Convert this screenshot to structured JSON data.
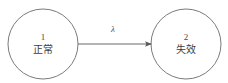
{
  "diagram": {
    "type": "state-transition-diagram",
    "background_color": "#ffffff",
    "stroke_color": "#6b6b6b",
    "text_color": "#3d3d3d",
    "states": [
      {
        "index": "1",
        "label": "正常",
        "cx": 43,
        "cy": 44,
        "r": 35
      },
      {
        "index": "2",
        "label": "失效",
        "cx": 186,
        "cy": 44,
        "r": 35
      }
    ],
    "transitions": [
      {
        "from": "1",
        "to": "2",
        "rate_label": "λ",
        "x1": 78,
        "y1": 44,
        "x2": 152,
        "y2": 44
      }
    ]
  }
}
